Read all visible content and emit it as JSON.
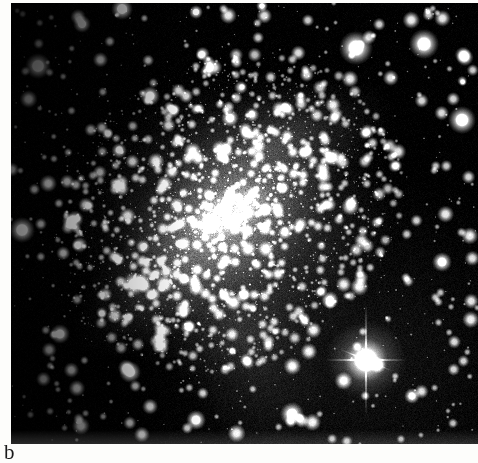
{
  "figure": {
    "panel_label": "b",
    "kind": "astronomical-photographic-plate",
    "color_mode": "grayscale",
    "plate": {
      "left": 11,
      "top": 3,
      "width": 467,
      "height": 441,
      "background_hex": "#000000",
      "highlight_hex": "#ffffff",
      "grain_mid_hex": "#4a4a4a"
    },
    "galaxy": {
      "core_x": 228,
      "core_y": 213,
      "core_brightness": 0.97,
      "core_angle_deg": -28,
      "core_radius_x": 46,
      "core_radius_y": 24,
      "halo_radius_x": 168,
      "halo_radius_y": 152,
      "halo_brightness": 0.34,
      "disk_angle_deg": -30
    },
    "bright_star": {
      "label": "foreground-star-with-diffraction-spikes",
      "x": 366,
      "y": 360,
      "core_radius": 13,
      "spike_length_vertical": 56,
      "spike_length_horizontal": 40
    },
    "notable_bright_blobs": [
      {
        "x": 38,
        "y": 66,
        "r": 13
      },
      {
        "x": 82,
        "y": 24,
        "r": 9
      },
      {
        "x": 122,
        "y": 9,
        "r": 11
      },
      {
        "x": 196,
        "y": 12,
        "r": 7
      },
      {
        "x": 262,
        "y": 6,
        "r": 6
      },
      {
        "x": 356,
        "y": 48,
        "r": 17
      },
      {
        "x": 424,
        "y": 44,
        "r": 15
      },
      {
        "x": 462,
        "y": 120,
        "r": 14
      },
      {
        "x": 150,
        "y": 96,
        "r": 10
      },
      {
        "x": 230,
        "y": 118,
        "r": 9
      },
      {
        "x": 306,
        "y": 152,
        "r": 8
      },
      {
        "x": 22,
        "y": 230,
        "r": 13
      },
      {
        "x": 134,
        "y": 284,
        "r": 12
      },
      {
        "x": 60,
        "y": 334,
        "r": 10
      },
      {
        "x": 130,
        "y": 372,
        "r": 11
      },
      {
        "x": 196,
        "y": 420,
        "r": 10
      },
      {
        "x": 292,
        "y": 414,
        "r": 12
      },
      {
        "x": 330,
        "y": 300,
        "r": 9
      },
      {
        "x": 442,
        "y": 262,
        "r": 10
      },
      {
        "x": 412,
        "y": 396,
        "r": 8
      }
    ],
    "star_field": {
      "dense_count": 1500,
      "sparse_count": 700,
      "grain_density": 0.55
    }
  }
}
